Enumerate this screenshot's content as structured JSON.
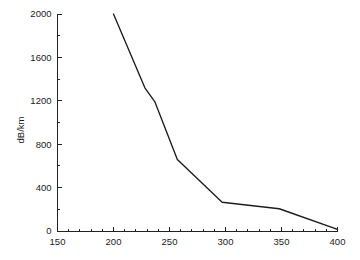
{
  "chart_data": {
    "type": "line",
    "title": "",
    "subtitle": "",
    "xlabel": "",
    "ylabel": "dB/km",
    "xlim": [
      150,
      400
    ],
    "ylim": [
      0,
      2000
    ],
    "grid": false,
    "legend": null,
    "x_ticks": [
      150,
      200,
      250,
      300,
      350,
      400
    ],
    "x_tick_labels": [
      "150",
      "200",
      "250",
      "300",
      "350",
      "400"
    ],
    "x_minor_step": 10,
    "y_ticks": [
      0,
      400,
      800,
      1200,
      1600,
      2000
    ],
    "y_tick_labels": [
      "0",
      "400",
      "800",
      "1200",
      "1600",
      "2000"
    ],
    "y_minor_step": 200,
    "series": [
      {
        "name": "attenuation",
        "color": "#1c1c1c",
        "x": [
          200,
          228,
          237,
          257,
          297,
          348,
          400
        ],
        "y": [
          2000,
          1320,
          1190,
          660,
          265,
          205,
          15
        ]
      }
    ]
  },
  "axis_titles": {
    "y": "dB/km",
    "x": ""
  },
  "colors": {
    "line": "#1c1c1c",
    "axis": "#222222",
    "text": "#1a1a1a",
    "background": "#ffffff"
  }
}
